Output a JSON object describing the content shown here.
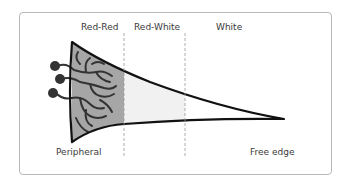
{
  "diagram": {
    "zones": [
      {
        "label": "Red-Red",
        "fill": "#a6a6a6"
      },
      {
        "label": "Red-White",
        "fill": "#f2f2f2"
      },
      {
        "label": "White",
        "fill": "#ffffff"
      }
    ],
    "bottom_labels": {
      "left": "Peripheral",
      "right": "Free edge"
    },
    "colors": {
      "outline": "#111111",
      "vessels": "#333333",
      "divider": "#9a9a9a",
      "border": "#b8b8b8"
    }
  }
}
